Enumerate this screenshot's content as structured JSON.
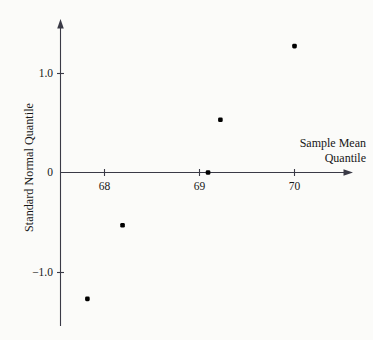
{
  "chart_data": {
    "type": "scatter",
    "title": "",
    "xlabel": "Sample Mean Quantile",
    "ylabel": "Standard Normal Quantile",
    "xlabel_lines": [
      "Sample Mean",
      "Quantile"
    ],
    "xlim": [
      67.45,
      70.6
    ],
    "ylim": [
      -1.52,
      1.52
    ],
    "xticks": [
      68,
      69,
      70
    ],
    "xtick_labels": [
      "68",
      "69",
      "70"
    ],
    "yticks": [
      -1.0,
      0,
      1.0
    ],
    "ytick_labels": [
      "−1.0",
      "0",
      "1.0"
    ],
    "grid": false,
    "legend": "none",
    "axis_style": "arrows",
    "marker": "filled-square-dot",
    "marker_color": "#000000",
    "axis_color": "#3a3a46",
    "background_color": "#fbfbf9",
    "x": [
      67.82,
      68.19,
      69.09,
      69.22,
      70.0
    ],
    "y": [
      -1.27,
      -0.53,
      0.0,
      0.53,
      1.27
    ],
    "points": [
      {
        "x": 67.82,
        "y": -1.27
      },
      {
        "x": 68.19,
        "y": -0.53
      },
      {
        "x": 69.09,
        "y": 0.0
      },
      {
        "x": 69.22,
        "y": 0.53
      },
      {
        "x": 70.0,
        "y": 1.27
      }
    ]
  },
  "axis": {
    "y_title": "Standard Normal Quantile",
    "x_title_line1": "Sample Mean",
    "x_title_line2": "Quantile",
    "ytick_0": "0",
    "ytick_pos1": "1.0",
    "ytick_neg1": "−1.0",
    "xtick_68": "68",
    "xtick_69": "69",
    "xtick_70": "70"
  }
}
